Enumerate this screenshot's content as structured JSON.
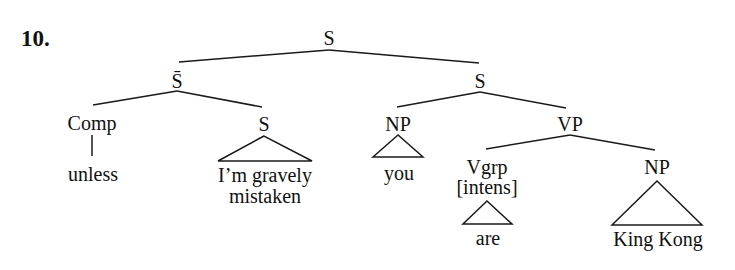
{
  "example_number": "10.",
  "colors": {
    "ink": "#111111",
    "background": "#ffffff"
  },
  "tree": {
    "root": "S",
    "nodes": {
      "s_root": "S",
      "s_bar": "S̄",
      "comp": "Comp",
      "s_sub": "S",
      "s_main": "S",
      "np_subj": "NP",
      "vp": "VP",
      "vgrp": "Vgrp",
      "vgrp_feature": "[intens]",
      "np_obj": "NP"
    },
    "leaves": {
      "unless": "unless",
      "clause_line1": "I’m gravely",
      "clause_line2": "mistaken",
      "you": "you",
      "are": "are",
      "king_kong": "King Kong"
    },
    "structure": [
      [
        "S",
        [
          "S̄",
          [
            "Comp",
            "unless"
          ],
          [
            "S",
            "△ I'm gravely mistaken"
          ]
        ],
        [
          "S",
          [
            "NP",
            "△ you"
          ],
          [
            "VP",
            [
              "Vgrp [intens]",
              "△ are"
            ],
            [
              "NP",
              "△ King Kong"
            ]
          ]
        ]
      ]
    ]
  }
}
